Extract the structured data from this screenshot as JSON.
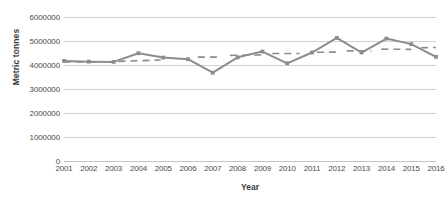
{
  "chart_data": {
    "type": "line",
    "title": "",
    "xlabel": "Year",
    "ylabel": "Metric tonnes",
    "grid": true,
    "legend": "none",
    "xlim": [
      2001,
      2016
    ],
    "ylim": [
      0,
      6000000
    ],
    "ytick_labels": [
      "6000000",
      "5000000",
      "4000000",
      "3000000",
      "2000000",
      "1000000",
      "0"
    ],
    "ytick_values": [
      6000000,
      5000000,
      4000000,
      3000000,
      2000000,
      1000000,
      0
    ],
    "categories": [
      "2001",
      "2002",
      "2003",
      "2004",
      "2005",
      "2006",
      "2007",
      "2008",
      "2009",
      "2010",
      "2011",
      "2012",
      "2013",
      "2014",
      "2015",
      "2016"
    ],
    "x": [
      2001,
      2002,
      2003,
      2004,
      2005,
      2006,
      2007,
      2008,
      2009,
      2010,
      2011,
      2012,
      2013,
      2014,
      2015,
      2016
    ],
    "series": [
      {
        "name": "Metric tonnes",
        "color": "#8c8c8c",
        "marker": "square",
        "style": "solid",
        "values": [
          4170000,
          4140000,
          4130000,
          4490000,
          4310000,
          4240000,
          3680000,
          4320000,
          4560000,
          4070000,
          4520000,
          5130000,
          4520000,
          5100000,
          4870000,
          4340000
        ]
      },
      {
        "name": "Trendline segments",
        "color": "#8c8c8c",
        "style": "dashed",
        "segments": [
          {
            "x_start": 2001.0,
            "x_end": 2002.3,
            "y_start": 4130000,
            "y_end": 4120000
          },
          {
            "x_start": 2003.2,
            "x_end": 2004.9,
            "y_start": 4150000,
            "y_end": 4210000
          },
          {
            "x_start": 2006.4,
            "x_end": 2007.2,
            "y_start": 4330000,
            "y_end": 4330000
          },
          {
            "x_start": 2007.7,
            "x_end": 2009.0,
            "y_start": 4400000,
            "y_end": 4420000
          },
          {
            "x_start": 2009.4,
            "x_end": 2010.5,
            "y_start": 4480000,
            "y_end": 4480000
          },
          {
            "x_start": 2011.2,
            "x_end": 2012.1,
            "y_start": 4530000,
            "y_end": 4540000
          },
          {
            "x_start": 2012.4,
            "x_end": 2013.4,
            "y_start": 4590000,
            "y_end": 4590000
          },
          {
            "x_start": 2013.8,
            "x_end": 2015.0,
            "y_start": 4660000,
            "y_end": 4650000
          },
          {
            "x_start": 2015.4,
            "x_end": 2016.0,
            "y_start": 4720000,
            "y_end": 4730000
          }
        ]
      }
    ]
  }
}
